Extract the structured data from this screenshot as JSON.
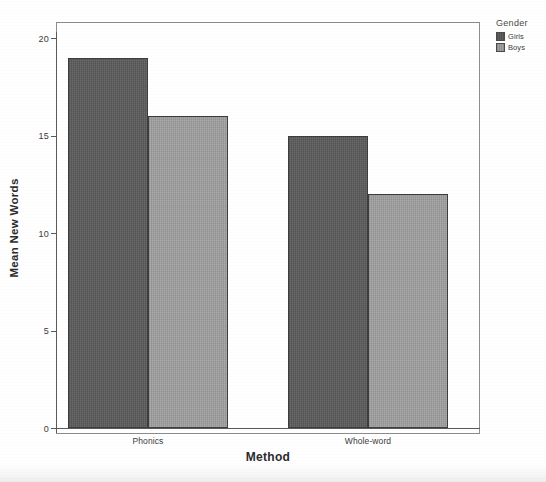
{
  "chart_data": {
    "type": "bar",
    "title": "",
    "subtitle": "",
    "xlabel": "Method",
    "ylabel": "Mean New Words",
    "categories": [
      "Phonics",
      "Whole-word"
    ],
    "series": [
      {
        "name": "Girls",
        "values": [
          19,
          15
        ],
        "color": "#595959"
      },
      {
        "name": "Boys",
        "values": [
          16,
          12
        ],
        "color": "#9a9a9a"
      }
    ],
    "legend_title": "Gender",
    "legend_position": "right-top",
    "ylim": [
      0,
      20
    ],
    "yticks": [
      0,
      5,
      10,
      15,
      20
    ],
    "ytick_labels": [
      "0",
      "5",
      "10",
      "15",
      "20"
    ],
    "grid": false,
    "grouped": "clustered",
    "frame": true
  },
  "axes": {
    "y_title": "Mean New Words",
    "x_title": "Method",
    "y_ticks": [
      {
        "label": "20",
        "value": 20
      },
      {
        "label": "15",
        "value": 15
      },
      {
        "label": "10",
        "value": 10
      },
      {
        "label": "5",
        "value": 5
      },
      {
        "label": "0",
        "value": 0
      }
    ],
    "x_categories": [
      {
        "label": "Phonics"
      },
      {
        "label": "Whole-word"
      }
    ]
  },
  "legend": {
    "title": "Gender",
    "items": [
      {
        "label": "Girls",
        "color": "#595959"
      },
      {
        "label": "Boys",
        "color": "#9a9a9a"
      }
    ]
  },
  "bars": [
    {
      "name": "phonics-girls",
      "group": "Phonics",
      "series": "Girls",
      "value": 19
    },
    {
      "name": "phonics-boys",
      "group": "Phonics",
      "series": "Boys",
      "value": 16
    },
    {
      "name": "whole-word-girls",
      "group": "Whole-word",
      "series": "Girls",
      "value": 15
    },
    {
      "name": "whole-word-boys",
      "group": "Whole-word",
      "series": "Boys",
      "value": 12
    }
  ]
}
